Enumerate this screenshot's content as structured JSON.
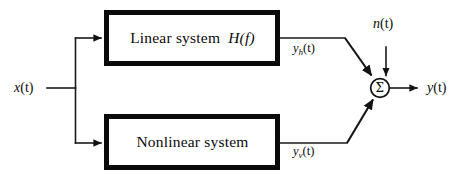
{
  "diagram": {
    "type": "block-diagram",
    "blocks": [
      {
        "id": "linear",
        "label": "Linear system",
        "transfer_function": "H(f)",
        "label_full": "Linear system H(f)"
      },
      {
        "id": "nonlinear",
        "label": "Nonlinear system",
        "label_full": "Nonlinear system"
      }
    ],
    "signals": {
      "input": {
        "base": "x",
        "arg": "(t)",
        "text": "x(t)"
      },
      "linear_output": {
        "base": "y",
        "subscript": "h",
        "arg": "(t)",
        "text": "y_h(t)"
      },
      "nonlinear_output": {
        "base": "y",
        "subscript": "v",
        "arg": "(t)",
        "text": "y_v(t)"
      },
      "noise": {
        "base": "n",
        "arg": "(t)",
        "text": "n(t)"
      },
      "output": {
        "base": "y",
        "arg": "(t)",
        "text": "y(t)"
      }
    },
    "summing_junction": {
      "symbol": "Σ",
      "name": "summation"
    },
    "colors": {
      "ink": "#0b0b0b",
      "block_border": "#0a0a0a",
      "wire": "#1a1a1a",
      "background": "#ffffff"
    }
  }
}
